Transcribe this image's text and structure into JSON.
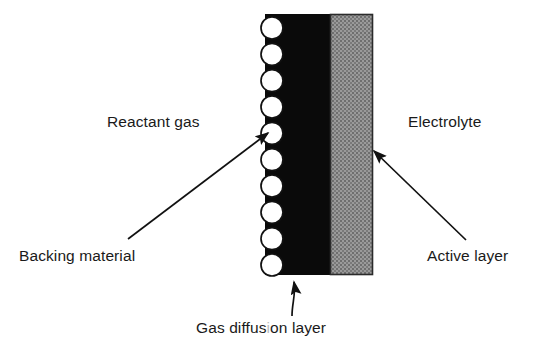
{
  "figure": {
    "background_color": "#ffffff"
  },
  "labels": {
    "reactant_gas": "Reactant gas",
    "electrolyte": "Electrolyte",
    "backing_material": "Backing material",
    "active_layer": "Active layer",
    "gas_diffusion_layer_part1": "Gas diffus",
    "gas_diffusion_layer_faded": "i",
    "gas_diffusion_layer_part2": "on layer",
    "gas_diffusion_layer_full": "Gas diffusion layer"
  },
  "layers": {
    "backing": {
      "name": "backing-material-layer",
      "color": "#0a0a0a",
      "x": 265,
      "y": 14,
      "width": 65,
      "height": 261
    },
    "active": {
      "name": "active-layer",
      "color": "#8a8a8a",
      "border_color": "#2b2b2b",
      "x": 330,
      "y": 14,
      "width": 43,
      "height": 261
    }
  },
  "particles": {
    "name": "backing-material-particles",
    "count": 10,
    "fill_color": "#ffffff",
    "stroke_color": "#111111",
    "radius": 11,
    "center_x": 272,
    "first_center_y": 28,
    "spacing": 26.3
  },
  "arrows": {
    "backing_material": {
      "from_x": 128,
      "from_y": 239,
      "to_x": 268,
      "to_y": 131,
      "style": "straight"
    },
    "active_layer": {
      "from_x": 466,
      "from_y": 240,
      "to_x": 372,
      "to_y": 150,
      "style": "straight"
    },
    "gas_diffusion_layer": {
      "from_x": 293,
      "from_y": 315,
      "to_x": 293,
      "to_y": 276,
      "style": "curved"
    }
  },
  "colors": {
    "ink": "#1a1a1a",
    "black_layer": "#0a0a0a",
    "gray_layer": "#8a8a8a",
    "page": "#ffffff"
  }
}
